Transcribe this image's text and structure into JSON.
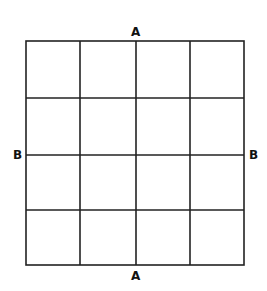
{
  "diagram": {
    "title": "",
    "grid": {
      "rows": 4,
      "cols": 4,
      "line_color": "#222222"
    },
    "labels": {
      "top": "A",
      "bottom": "A",
      "left": "B",
      "right": "B"
    }
  }
}
